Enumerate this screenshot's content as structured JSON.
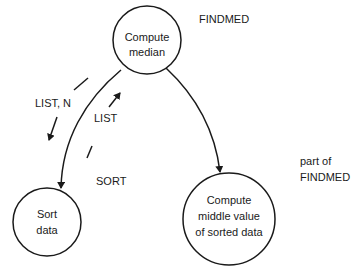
{
  "diagram": {
    "type": "structure-chart",
    "nodes": [
      {
        "id": "compute-median",
        "lines": [
          "Compute",
          "median"
        ]
      },
      {
        "id": "sort-data",
        "lines": [
          "Sort",
          "data"
        ]
      },
      {
        "id": "compute-middle",
        "lines": [
          "Compute",
          "middle value",
          "of sorted data"
        ]
      }
    ],
    "edges": [
      {
        "from": "compute-median",
        "to": "sort-data"
      },
      {
        "from": "compute-median",
        "to": "compute-middle"
      }
    ],
    "data_flows": [
      {
        "label": "LIST, N",
        "direction": "down",
        "edge": "compute-median->sort-data"
      },
      {
        "label": "LIST",
        "direction": "up",
        "edge": "sort-data->compute-median"
      }
    ],
    "annotations": {
      "findmed": "FINDMED",
      "sort": "SORT",
      "part_of_line1": "part of",
      "part_of_line2": "FINDMED"
    },
    "colors": {
      "stroke": "#1a1a1a",
      "background": "#ffffff"
    }
  }
}
